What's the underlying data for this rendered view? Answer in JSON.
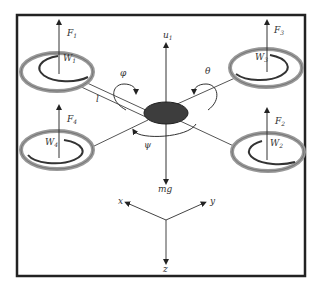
{
  "diagram": {
    "rotors": [
      {
        "id": "1",
        "force_label": "F",
        "force_sub": "1",
        "speed_label": "W",
        "speed_sub": "1"
      },
      {
        "id": "2",
        "force_label": "F",
        "force_sub": "2",
        "speed_label": "W",
        "speed_sub": "2"
      },
      {
        "id": "3",
        "force_label": "F",
        "force_sub": "3",
        "speed_label": "W",
        "speed_sub": "3"
      },
      {
        "id": "4",
        "force_label": "F",
        "force_sub": "4",
        "speed_label": "W",
        "speed_sub": "4"
      }
    ],
    "center": {
      "thrust_label": "u",
      "thrust_sub": "1",
      "gravity_label": "mg",
      "roll_label": "φ",
      "pitch_label": "θ",
      "yaw_label": "ψ",
      "arm_length_label": "l"
    },
    "axes": {
      "x": "x",
      "y": "y",
      "z": "z"
    },
    "colors": {
      "frame": "#222222",
      "body": "#3a3a3a",
      "ring": "#9a9a9a",
      "arrow": "#333333"
    }
  }
}
